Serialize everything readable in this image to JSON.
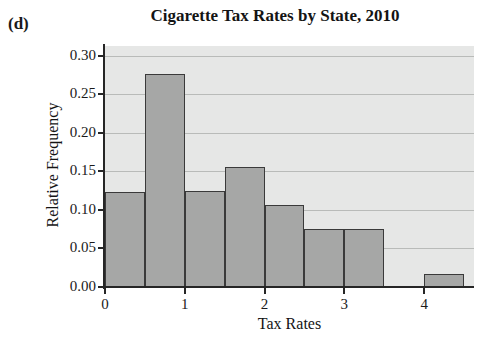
{
  "panel": {
    "label": "(d)"
  },
  "chart_data": {
    "type": "bar",
    "title": "Cigarette Tax Rates by State, 2010",
    "xlabel": "Tax Rates",
    "ylabel": "Relative Frequency",
    "xlim": [
      0,
      4.625
    ],
    "ylim": [
      0.0,
      0.3125
    ],
    "grid": true,
    "legend": null,
    "bin_width": 0.5,
    "bin_edges": [
      0.0,
      0.5,
      1.0,
      1.5,
      2.0,
      2.5,
      3.0,
      3.5,
      4.0,
      4.5
    ],
    "categories": [
      "0.0-0.5",
      "0.5-1.0",
      "1.0-1.5",
      "1.5-2.0",
      "2.0-2.5",
      "2.5-3.0",
      "3.0-3.5",
      "3.5-4.0",
      "4.0-4.5"
    ],
    "values": [
      0.123,
      0.276,
      0.124,
      0.156,
      0.106,
      0.075,
      0.075,
      0.0,
      0.017
    ],
    "bars": [
      {
        "x0": 0.0,
        "x1": 0.5,
        "value": 0.123
      },
      {
        "x0": 0.5,
        "x1": 1.0,
        "value": 0.276
      },
      {
        "x0": 1.0,
        "x1": 1.5,
        "value": 0.124
      },
      {
        "x0": 1.5,
        "x1": 2.0,
        "value": 0.156
      },
      {
        "x0": 2.0,
        "x1": 2.5,
        "value": 0.106
      },
      {
        "x0": 2.5,
        "x1": 3.0,
        "value": 0.075
      },
      {
        "x0": 3.0,
        "x1": 3.5,
        "value": 0.075
      },
      {
        "x0": 4.0,
        "x1": 4.5,
        "value": 0.017
      }
    ],
    "yticks": [
      {
        "value": 0.3,
        "label": "0.30"
      },
      {
        "value": 0.25,
        "label": "0.25"
      },
      {
        "value": 0.2,
        "label": "0.20"
      },
      {
        "value": 0.15,
        "label": "0.15"
      },
      {
        "value": 0.1,
        "label": "0.10"
      },
      {
        "value": 0.05,
        "label": "0.05"
      },
      {
        "value": 0.0,
        "label": "0.00"
      }
    ],
    "xticks": [
      {
        "value": 0,
        "label": "0"
      },
      {
        "value": 1,
        "label": "1"
      },
      {
        "value": 2,
        "label": "2"
      },
      {
        "value": 3,
        "label": "3"
      },
      {
        "value": 4,
        "label": "4"
      }
    ],
    "colors": {
      "bar_fill": "#a6a7a6",
      "bar_edge": "#3a3a3a",
      "plot_background": "#e6e7e6",
      "gridline": "#b9bbb9",
      "axis": "#262626",
      "text": "#141414",
      "figure_background": "#ffffff"
    }
  }
}
